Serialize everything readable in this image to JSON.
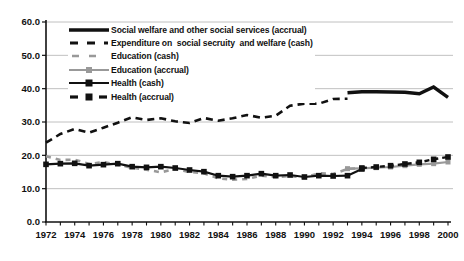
{
  "chart_data": {
    "type": "line",
    "title": "",
    "xlabel": "",
    "ylabel": "",
    "xlim": [
      1972,
      2000
    ],
    "ylim": [
      0,
      60
    ],
    "y_tick_labels": [
      "0.0",
      "10.0",
      "20.0",
      "30.0",
      "40.0",
      "50.0",
      "60.0"
    ],
    "x_tick_labels": [
      "1972",
      "1974",
      "1976",
      "1978",
      "1980",
      "1982",
      "1984",
      "1986",
      "1988",
      "1990",
      "1992",
      "1994",
      "1996",
      "1998",
      "2000"
    ],
    "grid": "horizontal",
    "legend_position": "top-left-inside",
    "colors": {
      "black_series": "#111111",
      "gray_series": "#999999",
      "gridline": "#b0b0b0"
    },
    "series": [
      {
        "name": "Social welfare and other social services (accrual)",
        "style": "solid-thick",
        "color": "#111111",
        "marker": "none",
        "points": [
          [
            1993,
            38.8
          ],
          [
            1994,
            39.1
          ],
          [
            1995,
            39.1
          ],
          [
            1996,
            39.0
          ],
          [
            1997,
            38.9
          ],
          [
            1998,
            38.5
          ],
          [
            1999,
            40.5
          ],
          [
            2000,
            37.4
          ]
        ]
      },
      {
        "name": "Expenditure on  social secruity  and welfare (cash)",
        "style": "dashed-long",
        "color": "#111111",
        "marker": "none",
        "points": [
          [
            1972,
            23.8
          ],
          [
            1973,
            26.4
          ],
          [
            1974,
            27.9
          ],
          [
            1975,
            26.8
          ],
          [
            1976,
            28.3
          ],
          [
            1977,
            29.8
          ],
          [
            1978,
            31.4
          ],
          [
            1979,
            30.6
          ],
          [
            1980,
            31.1
          ],
          [
            1981,
            30.2
          ],
          [
            1982,
            29.7
          ],
          [
            1983,
            31.2
          ],
          [
            1984,
            30.4
          ],
          [
            1985,
            31.1
          ],
          [
            1986,
            32.1
          ],
          [
            1987,
            31.3
          ],
          [
            1988,
            31.9
          ],
          [
            1989,
            34.9
          ],
          [
            1990,
            35.5
          ],
          [
            1991,
            35.5
          ],
          [
            1992,
            36.9
          ],
          [
            1993,
            37.0
          ]
        ]
      },
      {
        "name": "Education (cash)",
        "style": "dashed-short",
        "color": "#999999",
        "marker": "none",
        "points": [
          [
            1972,
            19.7
          ],
          [
            1973,
            18.6
          ],
          [
            1974,
            18.7
          ],
          [
            1975,
            17.4
          ],
          [
            1976,
            18.0
          ],
          [
            1977,
            17.2
          ],
          [
            1978,
            16.3
          ],
          [
            1979,
            15.7
          ],
          [
            1980,
            14.9
          ],
          [
            1981,
            15.9
          ],
          [
            1982,
            15.0
          ],
          [
            1983,
            14.6
          ],
          [
            1984,
            13.1
          ],
          [
            1985,
            12.7
          ],
          [
            1986,
            12.9
          ],
          [
            1987,
            13.9
          ],
          [
            1988,
            13.5
          ],
          [
            1989,
            13.8
          ],
          [
            1990,
            13.3
          ],
          [
            1991,
            14.6
          ],
          [
            1992,
            14.4
          ],
          [
            1993,
            15.9
          ],
          [
            1994,
            16.2
          ]
        ]
      },
      {
        "name": "Education (accrual)",
        "style": "solid",
        "color": "#999999",
        "marker": "square",
        "points": [
          [
            1993,
            16.0
          ],
          [
            1994,
            16.1
          ],
          [
            1995,
            16.3
          ],
          [
            1996,
            16.5
          ],
          [
            1997,
            16.9
          ],
          [
            1998,
            17.3
          ],
          [
            1999,
            17.5
          ],
          [
            2000,
            18.0
          ]
        ]
      },
      {
        "name": "Health (cash)",
        "style": "solid",
        "color": "#111111",
        "marker": "square",
        "points": [
          [
            1972,
            17.3
          ],
          [
            1973,
            17.5
          ],
          [
            1974,
            17.6
          ],
          [
            1975,
            16.9
          ],
          [
            1976,
            17.2
          ],
          [
            1977,
            17.5
          ],
          [
            1978,
            16.6
          ],
          [
            1979,
            16.4
          ],
          [
            1980,
            16.6
          ],
          [
            1981,
            16.2
          ],
          [
            1982,
            15.6
          ],
          [
            1983,
            15.1
          ],
          [
            1984,
            13.9
          ],
          [
            1985,
            13.6
          ],
          [
            1986,
            13.9
          ],
          [
            1987,
            14.5
          ],
          [
            1988,
            13.9
          ],
          [
            1989,
            14.1
          ],
          [
            1990,
            13.5
          ],
          [
            1991,
            13.9
          ],
          [
            1992,
            13.8
          ],
          [
            1993,
            13.9
          ],
          [
            1994,
            15.9
          ]
        ]
      },
      {
        "name": "Health (accrual)",
        "style": "dashed-marker",
        "color": "#111111",
        "marker": "square",
        "points": [
          [
            1994,
            16.2
          ],
          [
            1995,
            16.5
          ],
          [
            1996,
            16.9
          ],
          [
            1997,
            17.4
          ],
          [
            1998,
            17.9
          ],
          [
            1999,
            18.8
          ],
          [
            2000,
            19.5
          ]
        ]
      }
    ]
  }
}
